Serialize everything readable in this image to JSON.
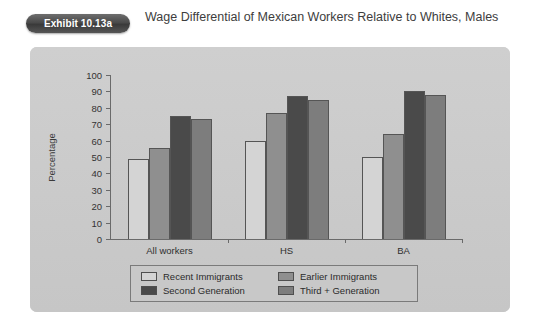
{
  "header": {
    "badge_label": "Exhibit 10.13a",
    "title": "Wage Differential of Mexican Workers Relative to Whites, Males"
  },
  "chart_data": {
    "type": "bar",
    "title": "Wage Differential of Mexican Workers Relative to Whites, Males",
    "xlabel": "",
    "ylabel": "Percentage",
    "ylim": [
      0,
      100
    ],
    "ytick_step": 10,
    "yticks": [
      "100",
      "90",
      "80",
      "70",
      "60",
      "50",
      "40",
      "30",
      "20",
      "10",
      "0"
    ],
    "grid": false,
    "legend_position": "bottom",
    "categories": [
      "All workers",
      "HS",
      "BA"
    ],
    "series": [
      {
        "name": "Recent Immigrants",
        "color": "#d4d4d4",
        "values": [
          48.5,
          60.0,
          50.0
        ]
      },
      {
        "name": "Earlier Immigrants",
        "color": "#8f8f8f",
        "values": [
          55.5,
          77.0,
          64.0
        ]
      },
      {
        "name": "Second Generation",
        "color": "#4a4a4a",
        "values": [
          75.0,
          87.5,
          90.0
        ]
      },
      {
        "name": "Third + Generation",
        "color": "#7d7d7d",
        "values": [
          73.0,
          85.0,
          88.0
        ]
      }
    ]
  },
  "colors": {
    "panel_background": "#c9c9c9",
    "page_background": "#ffffff",
    "badge_background": "#4a4a4a",
    "axis": "#6a6a6a",
    "text": "#2f2f2f"
  }
}
